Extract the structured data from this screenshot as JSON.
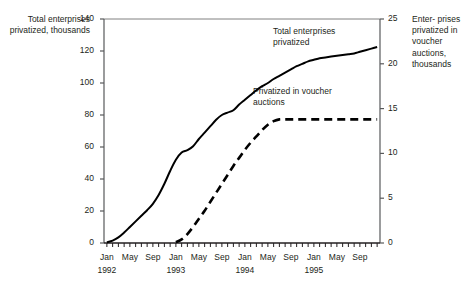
{
  "chart_data": {
    "type": "line",
    "title": "",
    "xlabel": "",
    "ylabel": "Total enterprises privatized, thousands",
    "y2label": "Enterprises privatized in voucher auctions, thousands",
    "ylim": [
      0,
      140
    ],
    "y2lim": [
      0,
      25
    ],
    "ytick_labels": [
      "140",
      "120",
      "100",
      "80",
      "60",
      "40",
      "20",
      "0"
    ],
    "ytick_values": [
      140,
      120,
      100,
      80,
      60,
      40,
      20,
      0
    ],
    "y2tick_labels": [
      "25",
      "20",
      "15",
      "10",
      "5",
      "0"
    ],
    "y2tick_values": [
      25,
      20,
      15,
      10,
      5,
      0
    ],
    "grid": false,
    "legend_position": "inline-annotations",
    "x_tick_interval": "monthly",
    "x_range": [
      "1992-01",
      "1995-12"
    ],
    "xtick_labels": [
      "Jan",
      "May",
      "Sep",
      "Jan",
      "May",
      "Sep",
      "Jan",
      "May",
      "Sep",
      "Jan",
      "May",
      "Sep"
    ],
    "xyear_labels": [
      "1992",
      "1993",
      "1994",
      "1995"
    ],
    "x": [
      "1992-01",
      "1992-02",
      "1992-03",
      "1992-04",
      "1992-05",
      "1992-06",
      "1992-07",
      "1992-08",
      "1992-09",
      "1992-10",
      "1992-11",
      "1992-12",
      "1993-01",
      "1993-02",
      "1993-03",
      "1993-04",
      "1993-05",
      "1993-06",
      "1993-07",
      "1993-08",
      "1993-09",
      "1993-10",
      "1993-11",
      "1993-12",
      "1994-01",
      "1994-02",
      "1994-03",
      "1994-04",
      "1994-05",
      "1994-06",
      "1994-07",
      "1994-08",
      "1994-09",
      "1994-10",
      "1994-11",
      "1994-12",
      "1995-01",
      "1995-02",
      "1995-03",
      "1995-04",
      "1995-05",
      "1995-06",
      "1995-07",
      "1995-08",
      "1995-09",
      "1995-10",
      "1995-11",
      "1995-12"
    ],
    "series": [
      {
        "name": "Total enterprises privatized",
        "axis": "left",
        "style": "solid",
        "color": "#000000",
        "annotation": "Total enterprises privatized",
        "values": [
          0.5,
          1.5,
          3.5,
          6.5,
          10.0,
          13.5,
          17.0,
          20.5,
          24.5,
          30.0,
          37.0,
          45.0,
          52.0,
          56.5,
          58.0,
          60.5,
          65.0,
          69.0,
          73.0,
          77.0,
          80.0,
          81.5,
          83.0,
          86.5,
          89.5,
          92.5,
          95.5,
          98.0,
          100.0,
          102.5,
          104.5,
          106.5,
          108.5,
          110.5,
          112.0,
          113.5,
          114.5,
          115.5,
          116.0,
          116.5,
          117.0,
          117.5,
          118.0,
          118.5,
          119.5,
          120.5,
          121.5,
          122.5
        ]
      },
      {
        "name": "Privatized in voucher auctions",
        "axis": "right",
        "style": "dashed",
        "color": "#000000",
        "annotation": "Privatized in voucher auctions",
        "values": [
          null,
          null,
          null,
          null,
          null,
          null,
          null,
          null,
          null,
          null,
          null,
          null,
          0.1,
          0.4,
          1.0,
          1.8,
          2.7,
          3.6,
          4.6,
          5.6,
          6.6,
          7.6,
          8.6,
          9.5,
          10.4,
          11.2,
          11.9,
          12.6,
          13.2,
          13.6,
          13.8,
          13.8,
          13.8,
          13.8,
          13.8,
          13.8,
          13.8,
          13.8,
          13.8,
          13.8,
          13.8,
          13.8,
          13.8,
          13.8,
          13.8,
          13.8,
          13.8,
          13.8
        ]
      }
    ]
  },
  "labels": {
    "left_axis_title": "Total enterprises privatized, thousands",
    "right_axis_title": "Enter- prises privatized in voucher auctions, thousands",
    "annotation_total": "Total enterprises privatized",
    "annotation_voucher": "Privatized in voucher auctions"
  }
}
